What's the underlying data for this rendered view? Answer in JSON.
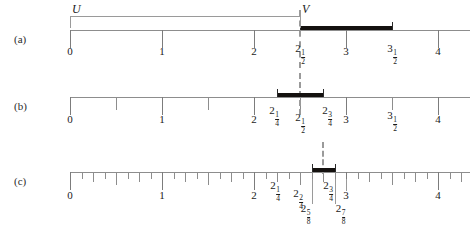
{
  "figure": {
    "axis_min": 0,
    "axis_max": 4.35,
    "unit_px": 92,
    "origin_px": 70,
    "colors": {
      "axis": "#8d8d8d",
      "bar": "#14110f",
      "dashed": "#9a9a9a",
      "text": "#1a1a1a"
    }
  },
  "panels": [
    {
      "id": "a",
      "label": "(a)",
      "set_labels": [
        {
          "name": "U",
          "text": "U",
          "x": 0
        },
        {
          "name": "V",
          "text": "V",
          "x": 2.5
        }
      ],
      "tick_step": 1,
      "ticks": [
        {
          "value": 0,
          "label": "0",
          "whole": "0",
          "frac_num": "",
          "frac_den": ""
        },
        {
          "value": 1,
          "label": "1",
          "whole": "1",
          "frac_num": "",
          "frac_den": ""
        },
        {
          "value": 2,
          "label": "2",
          "whole": "2",
          "frac_num": "",
          "frac_den": ""
        },
        {
          "value": 2.5,
          "label": "2 1/2",
          "whole": "2",
          "frac_num": "1",
          "frac_den": "2"
        },
        {
          "value": 3,
          "label": "3",
          "whole": "3",
          "frac_num": "",
          "frac_den": ""
        },
        {
          "value": 3.5,
          "label": "3 1/2",
          "whole": "3",
          "frac_num": "1",
          "frac_den": "2"
        },
        {
          "value": 4,
          "label": "4",
          "whole": "4",
          "frac_num": "",
          "frac_den": ""
        }
      ],
      "bar": {
        "start": 2.5,
        "end": 3.5
      },
      "dashed_at": 2.5
    },
    {
      "id": "b",
      "label": "(b)",
      "set_labels": [],
      "tick_step": 0.5,
      "ticks": [
        {
          "value": 0,
          "label": "0",
          "whole": "0",
          "frac_num": "",
          "frac_den": ""
        },
        {
          "value": 1,
          "label": "1",
          "whole": "1",
          "frac_num": "",
          "frac_den": ""
        },
        {
          "value": 2,
          "label": "2",
          "whole": "2",
          "frac_num": "",
          "frac_den": ""
        },
        {
          "value": 2.25,
          "label": "2 1/4",
          "whole": "2",
          "frac_num": "1",
          "frac_den": "4"
        },
        {
          "value": 2.5,
          "label": "2 1/2",
          "whole": "2",
          "frac_num": "1",
          "frac_den": "2"
        },
        {
          "value": 2.75,
          "label": "2 3/4",
          "whole": "2",
          "frac_num": "3",
          "frac_den": "4"
        },
        {
          "value": 3,
          "label": "3",
          "whole": "3",
          "frac_num": "",
          "frac_den": ""
        },
        {
          "value": 3.5,
          "label": "3 1/2",
          "whole": "3",
          "frac_num": "1",
          "frac_den": "2"
        },
        {
          "value": 4,
          "label": "4",
          "whole": "4",
          "frac_num": "",
          "frac_den": ""
        }
      ],
      "bar": {
        "start": 2.25,
        "end": 2.75
      },
      "dashed_at": 2.5
    },
    {
      "id": "c",
      "label": "(c)",
      "set_labels": [],
      "tick_step": 0.125,
      "ticks": [
        {
          "value": 0,
          "label": "0",
          "whole": "0",
          "frac_num": "",
          "frac_den": ""
        },
        {
          "value": 1,
          "label": "1",
          "whole": "1",
          "frac_num": "",
          "frac_den": ""
        },
        {
          "value": 2,
          "label": "2",
          "whole": "2",
          "frac_num": "",
          "frac_den": ""
        },
        {
          "value": 2.25,
          "label": "2 1/4",
          "whole": "2",
          "frac_num": "1",
          "frac_den": "4"
        },
        {
          "value": 2.5,
          "label": "2 2/4",
          "whole": "2",
          "frac_num": "2",
          "frac_den": "4"
        },
        {
          "value": 2.625,
          "label": "2 5/8",
          "whole": "2",
          "frac_num": "5",
          "frac_den": "8"
        },
        {
          "value": 2.75,
          "label": "2 3/4",
          "whole": "2",
          "frac_num": "3",
          "frac_den": "4"
        },
        {
          "value": 2.875,
          "label": "2 7/8",
          "whole": "2",
          "frac_num": "7",
          "frac_den": "8"
        },
        {
          "value": 3,
          "label": "3",
          "whole": "3",
          "frac_num": "",
          "frac_den": ""
        },
        {
          "value": 4,
          "label": "4",
          "whole": "4",
          "frac_num": "",
          "frac_den": ""
        }
      ],
      "bar": {
        "start": 2.625,
        "end": 2.875
      },
      "dashed_at": 2.75
    }
  ]
}
